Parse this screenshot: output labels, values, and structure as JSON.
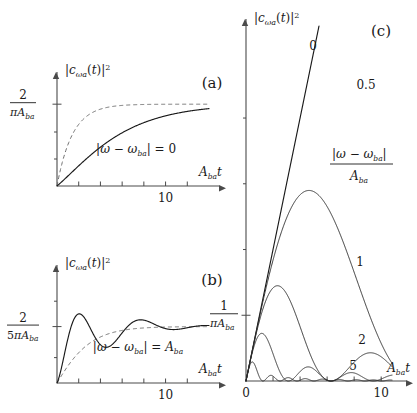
{
  "figure": {
    "background": "#ffffff",
    "ink": "#1a1a1a",
    "dash_color": "#707070"
  },
  "panels": {
    "a": {
      "tag": "(a)",
      "ylabel": "|cωa(t)|²",
      "ylabel_parts": {
        "abs_open": "|",
        "c": "c",
        "sub": "ωa",
        "arg": "(t)",
        "abs_close": "|",
        "sup": "2"
      },
      "ytick_label": {
        "numerator": "2",
        "denominator": "πAba",
        "denominator_sym": "πA",
        "denominator_sub": "ba"
      },
      "xlabel": {
        "sym": "A",
        "sub": "ba",
        "var": "t"
      },
      "xtick_labels": [
        "10"
      ],
      "annotation": {
        "expr": "|ω − ωba| = 0",
        "lhs_abs": "|ω − ω",
        "lhs_sub": "ba",
        "rhs": "| = 0"
      },
      "xlim": [
        0,
        14
      ],
      "ylim": [
        0,
        1.32
      ],
      "xticks": [
        2,
        4,
        6,
        8,
        10,
        12
      ],
      "asymptote": 1.0,
      "detuning": 0
    },
    "b": {
      "tag": "(b)",
      "ylabel": "|cωa(t)|²",
      "ytick_label": {
        "numerator": "2",
        "denominator_sym": "5πA",
        "denominator_sub": "ba"
      },
      "xlabel": {
        "sym": "A",
        "sub": "ba",
        "var": "t"
      },
      "xtick_labels": [
        "10"
      ],
      "annotation": {
        "lhs_abs": "|ω − ω",
        "lhs_sub": "ba",
        "mid": "| = ",
        "rhs_sym": "A",
        "rhs_sub": "ba"
      },
      "xlim": [
        0,
        14
      ],
      "ylim": [
        0,
        1.95
      ],
      "xticks": [
        2,
        4,
        6,
        8,
        10,
        12
      ],
      "asymptote": 1.0,
      "detuning": 1
    },
    "c": {
      "tag": "(c)",
      "ylabel": "|cωa(t)|²",
      "ytick_label": {
        "numerator": "1",
        "denominator_sym": "πA",
        "denominator_sub": "ba"
      },
      "xlabel": {
        "sym": "A",
        "sub": "ba",
        "var": "t"
      },
      "xtick_labels": [
        "0",
        "10"
      ],
      "legend_title": {
        "numerator_abs": "|ω − ω",
        "numerator_sub": "ba",
        "numerator_close": "|",
        "denominator_sym": "A",
        "denominator_sub": "ba"
      },
      "xlim": [
        0,
        10.8
      ],
      "ylim": [
        0,
        5.4
      ],
      "xticks": [
        2,
        4,
        6,
        8,
        10
      ],
      "yticks": [
        1,
        2,
        3,
        4
      ],
      "curve_labels": [
        "0",
        "0.5",
        "1",
        "2",
        "5"
      ]
    }
  },
  "chart_data": {
    "type": "line",
    "title": "",
    "panels": [
      {
        "id": "a",
        "label": "(a)",
        "xlabel": "A_ba t",
        "ylabel": "|c_wa(t)|^2",
        "xlim": [
          0,
          14
        ],
        "ylim": [
          0,
          1.32
        ],
        "xticks": [
          2,
          4,
          6,
          8,
          10,
          12
        ],
        "xtick_labels": {
          "10": "10"
        },
        "ytick_labels": {
          "1.0": "2/(pi A_ba)"
        },
        "grid": false,
        "legend": "none",
        "annotation": "|w - w_ba| = 0",
        "series": [
          {
            "name": "solid-exact",
            "style": "solid",
            "x": [
              0,
              0.5,
              1,
              1.5,
              2,
              2.5,
              3,
              3.5,
              4,
              4.5,
              5,
              5.5,
              6,
              6.5,
              7,
              7.5,
              8,
              9,
              10,
              11,
              12,
              13,
              14
            ],
            "values": [
              0,
              0.07,
              0.21,
              0.36,
              0.5,
              0.61,
              0.7,
              0.765,
              0.82,
              0.86,
              0.89,
              0.915,
              0.935,
              0.95,
              0.96,
              0.968,
              0.975,
              0.985,
              0.991,
              0.995,
              0.997,
              0.998,
              0.999
            ]
          },
          {
            "name": "dashed-approx",
            "style": "dashed",
            "x": [
              0,
              0.5,
              1,
              1.5,
              2,
              2.5,
              3,
              3.5,
              4,
              4.5,
              5,
              6,
              7,
              8,
              9,
              10,
              11,
              12,
              13,
              14
            ],
            "values": [
              0,
              0.3,
              0.52,
              0.67,
              0.78,
              0.845,
              0.89,
              0.92,
              0.942,
              0.957,
              0.968,
              0.982,
              0.99,
              0.994,
              0.996,
              0.998,
              0.999,
              1.0,
              1.0,
              1.0
            ]
          }
        ]
      },
      {
        "id": "b",
        "label": "(b)",
        "xlabel": "A_ba t",
        "ylabel": "|c_wa(t)|^2",
        "xlim": [
          0,
          14
        ],
        "ylim": [
          0,
          1.95
        ],
        "xticks": [
          2,
          4,
          6,
          8,
          10,
          12
        ],
        "xtick_labels": {
          "10": "10"
        },
        "ytick_labels": {
          "1.0": "2/(5 pi A_ba)"
        },
        "grid": false,
        "legend": "none",
        "annotation": "|w - w_ba| = A_ba",
        "series": [
          {
            "name": "solid-exact",
            "style": "solid",
            "x": [
              0,
              0.5,
              1,
              1.5,
              2,
              2.5,
              3,
              3.5,
              4,
              4.5,
              5,
              5.5,
              6,
              6.5,
              7,
              7.5,
              8,
              8.5,
              9,
              9.5,
              10,
              10.5,
              11,
              12,
              13,
              14
            ],
            "values": [
              0,
              0.23,
              0.74,
              1.27,
              1.6,
              1.72,
              1.66,
              1.48,
              1.24,
              1.0,
              0.83,
              0.74,
              0.72,
              0.76,
              0.84,
              0.92,
              0.99,
              1.04,
              1.06,
              1.05,
              1.02,
              0.99,
              0.97,
              0.97,
              0.99,
              1.0
            ]
          },
          {
            "name": "dashed-approx",
            "style": "dashed",
            "x": [
              0,
              0.5,
              1,
              1.5,
              2,
              2.5,
              3,
              3.5,
              4,
              4.5,
              5,
              6,
              7,
              8,
              9,
              10,
              11,
              12,
              13,
              14
            ],
            "values": [
              0,
              0.14,
              0.38,
              0.6,
              0.75,
              0.85,
              0.91,
              0.94,
              0.96,
              0.97,
              0.98,
              0.99,
              0.995,
              0.998,
              1.0,
              1.0,
              1.0,
              1.0,
              1.0,
              1.0
            ]
          }
        ]
      },
      {
        "id": "c",
        "label": "(c)",
        "xlabel": "A_ba t",
        "ylabel": "|c_wa(t)|^2",
        "xlim": [
          0,
          10.8
        ],
        "ylim": [
          0,
          5.4
        ],
        "xticks": [
          0,
          2,
          4,
          6,
          8,
          10
        ],
        "xtick_labels": {
          "0": "0",
          "10": "10"
        },
        "yticks": [
          1,
          2,
          3,
          4
        ],
        "ytick_labels": {
          "1": "1/(pi A_ba)"
        },
        "grid": false,
        "legend": "curve-labels",
        "legend_title": "|w - w_ba| / A_ba",
        "series": [
          {
            "name": "0",
            "detuning": 0,
            "x": [
              0,
              1,
              2,
              3,
              4,
              5,
              6,
              7,
              8
            ],
            "values": [
              0,
              0.67,
              1.35,
              2.0,
              2.7,
              3.4,
              4.1,
              4.75,
              5.4
            ]
          },
          {
            "name": "0.5",
            "detuning": 0.5,
            "x": [
              0,
              0.5,
              1,
              1.5,
              2,
              2.5,
              3,
              3.5,
              4,
              4.5,
              5,
              5.5,
              6,
              6.5,
              7,
              8,
              9,
              10,
              10.5
            ],
            "values": [
              0,
              0.34,
              0.69,
              1.0,
              1.3,
              1.53,
              1.66,
              1.7,
              1.66,
              1.56,
              1.43,
              1.3,
              1.2,
              1.12,
              1.07,
              1.0,
              0.97,
              0.96,
              0.96
            ]
          },
          {
            "name": "1",
            "detuning": 1,
            "x": [
              0,
              0.5,
              1,
              1.5,
              2,
              2.5,
              3,
              3.5,
              4,
              4.5,
              5,
              5.5,
              6,
              6.5,
              7,
              7.5,
              8,
              8.5,
              9,
              9.5,
              10,
              10.5
            ],
            "values": [
              0,
              0.22,
              0.62,
              1.0,
              1.22,
              1.28,
              1.22,
              1.05,
              0.85,
              0.66,
              0.53,
              0.46,
              0.45,
              0.49,
              0.56,
              0.62,
              0.66,
              0.68,
              0.68,
              0.67,
              0.66,
              0.66
            ]
          },
          {
            "name": "2",
            "detuning": 2,
            "x": [
              0,
              0.4,
              0.8,
              1.2,
              1.6,
              2,
              2.4,
              2.8,
              3.2,
              3.6,
              4,
              4.4,
              4.8,
              5.2,
              5.6,
              6,
              6.5,
              7,
              7.5,
              8,
              8.5,
              9,
              9.5,
              10,
              10.5
            ],
            "values": [
              0,
              0.1,
              0.3,
              0.5,
              0.62,
              0.65,
              0.58,
              0.44,
              0.28,
              0.16,
              0.1,
              0.13,
              0.21,
              0.28,
              0.31,
              0.29,
              0.24,
              0.22,
              0.24,
              0.27,
              0.28,
              0.26,
              0.24,
              0.25,
              0.26
            ]
          },
          {
            "name": "5",
            "detuning": 5,
            "x": [
              0,
              0.2,
              0.4,
              0.6,
              0.8,
              1,
              1.2,
              1.4,
              1.6,
              1.8,
              2,
              2.4,
              2.8,
              3.2,
              3.6,
              4,
              4.5,
              5,
              5.5,
              6,
              6.5,
              7,
              7.5,
              8,
              8.5,
              9,
              9.5,
              10,
              10.5
            ],
            "values": [
              0,
              0.05,
              0.15,
              0.2,
              0.16,
              0.08,
              0.02,
              0.02,
              0.06,
              0.1,
              0.09,
              0.03,
              0.03,
              0.08,
              0.07,
              0.02,
              0.05,
              0.07,
              0.03,
              0.04,
              0.07,
              0.04,
              0.04,
              0.06,
              0.05,
              0.04,
              0.06,
              0.05,
              0.05
            ]
          }
        ]
      }
    ]
  }
}
